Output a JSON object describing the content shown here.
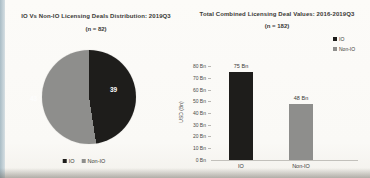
{
  "pie": {
    "title": "IO Vs Non-IO Licensing Deals Distribution: 2019Q3",
    "subtitle": "(n = 82)",
    "value_labels": {
      "io": "39",
      "non_io": "43"
    },
    "legend": [
      {
        "label": "IO"
      },
      {
        "label": "Non-IO"
      }
    ]
  },
  "bar": {
    "title": "Total Combined Licensing Deal Values: 2016-2019Q3",
    "subtitle": "(n = 182)",
    "ylabel": "USD (Bn)",
    "yticks": [
      "80 Bn",
      "70 Bn",
      "60 Bn",
      "50 Bn",
      "40 Bn",
      "30 Bn",
      "20 Bn",
      "10 Bn",
      "0 Bn"
    ],
    "bar_value_labels": [
      "75 Bn",
      "48 Bn"
    ],
    "categories": [
      "IO",
      "Non-IO"
    ],
    "legend": [
      {
        "label": "IO"
      },
      {
        "label": "Non-IO"
      }
    ]
  },
  "colors": {
    "io": "#1e1d1b",
    "non_io": "#8e8e8c"
  },
  "chart_data": [
    {
      "type": "pie",
      "title": "IO Vs Non-IO Licensing Deals Distribution: 2019Q3",
      "subtitle": "(n = 82)",
      "categories": [
        "IO",
        "Non-IO"
      ],
      "values": [
        39,
        43
      ],
      "colors": [
        "#1e1d1b",
        "#8e8e8c"
      ],
      "data_labels": [
        "39",
        "43"
      ],
      "legend_position": "bottom",
      "start_angle_deg": 0,
      "direction": "clockwise"
    },
    {
      "type": "bar",
      "title": "Total Combined Licensing Deal Values: 2016-2019Q3",
      "subtitle": "(n = 182)",
      "categories": [
        "IO",
        "Non-IO"
      ],
      "values": [
        75,
        48
      ],
      "data_labels": [
        "75 Bn",
        "48 Bn"
      ],
      "colors": [
        "#1e1d1b",
        "#8e8e8c"
      ],
      "xlabel": "",
      "ylabel": "USD (Bn)",
      "ylim": [
        0,
        80
      ],
      "ytick_step": 10,
      "grid": false,
      "legend_position": "top-right"
    }
  ]
}
